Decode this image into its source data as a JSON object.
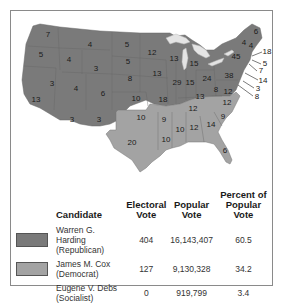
{
  "colors": {
    "republican": "#7a7a7a",
    "democrat": "#a3a3a3",
    "lakes": "#e4e4e4",
    "border": "#8a8a8a",
    "background": "#ffffff"
  },
  "map": {
    "title": "1920 Presidential Election Electoral Votes by State",
    "state_labels": [
      {
        "value": "7",
        "x": 48,
        "y": 37
      },
      {
        "value": "5",
        "x": 41,
        "y": 57
      },
      {
        "value": "4",
        "x": 69,
        "y": 62
      },
      {
        "value": "3",
        "x": 52,
        "y": 86
      },
      {
        "value": "13",
        "x": 36,
        "y": 102
      },
      {
        "value": "4",
        "x": 90,
        "y": 47
      },
      {
        "value": "3",
        "x": 96,
        "y": 71
      },
      {
        "value": "4",
        "x": 76,
        "y": 91
      },
      {
        "value": "3",
        "x": 72,
        "y": 122
      },
      {
        "value": "3",
        "x": 99,
        "y": 122
      },
      {
        "value": "6",
        "x": 103,
        "y": 96
      },
      {
        "value": "5",
        "x": 127,
        "y": 47
      },
      {
        "value": "5",
        "x": 128,
        "y": 64
      },
      {
        "value": "8",
        "x": 130,
        "y": 81
      },
      {
        "value": "10",
        "x": 136,
        "y": 101
      },
      {
        "value": "10",
        "x": 141,
        "y": 120
      },
      {
        "value": "20",
        "x": 132,
        "y": 145
      },
      {
        "value": "12",
        "x": 152,
        "y": 55
      },
      {
        "value": "13",
        "x": 157,
        "y": 76
      },
      {
        "value": "18",
        "x": 163,
        "y": 102
      },
      {
        "value": "9",
        "x": 164,
        "y": 122
      },
      {
        "value": "10",
        "x": 166,
        "y": 142
      },
      {
        "value": "13",
        "x": 174,
        "y": 61
      },
      {
        "value": "29",
        "x": 177,
        "y": 85
      },
      {
        "value": "15",
        "x": 190,
        "y": 85
      },
      {
        "value": "15",
        "x": 194,
        "y": 66
      },
      {
        "value": "24",
        "x": 207,
        "y": 81
      },
      {
        "value": "13",
        "x": 200,
        "y": 99
      },
      {
        "value": "12",
        "x": 193,
        "y": 111
      },
      {
        "value": "10",
        "x": 180,
        "y": 132
      },
      {
        "value": "12",
        "x": 194,
        "y": 130
      },
      {
        "value": "14",
        "x": 211,
        "y": 127
      },
      {
        "value": "9",
        "x": 223,
        "y": 119
      },
      {
        "value": "12",
        "x": 227,
        "y": 105
      },
      {
        "value": "8",
        "x": 216,
        "y": 92
      },
      {
        "value": "12",
        "x": 228,
        "y": 94
      },
      {
        "value": "38",
        "x": 229,
        "y": 78
      },
      {
        "value": "45",
        "x": 236,
        "y": 59
      },
      {
        "value": "4",
        "x": 244,
        "y": 45
      },
      {
        "value": "4",
        "x": 251,
        "y": 48
      },
      {
        "value": "6",
        "x": 256,
        "y": 34
      },
      {
        "value": "6",
        "x": 225,
        "y": 153
      }
    ],
    "callouts": [
      {
        "value": "18",
        "x": 267,
        "y": 54,
        "lx1": 252,
        "ly1": 56,
        "lx2": 262,
        "ly2": 52
      },
      {
        "value": "5",
        "x": 265,
        "y": 66,
        "lx1": 252,
        "ly1": 60,
        "lx2": 261,
        "ly2": 64
      },
      {
        "value": "7",
        "x": 261,
        "y": 73,
        "lx1": 249,
        "ly1": 64,
        "lx2": 257,
        "ly2": 71
      },
      {
        "value": "14",
        "x": 263,
        "y": 83,
        "lx1": 245,
        "ly1": 73,
        "lx2": 258,
        "ly2": 80
      },
      {
        "value": "3",
        "x": 258,
        "y": 91,
        "lx1": 243,
        "ly1": 81,
        "lx2": 254,
        "ly2": 88
      },
      {
        "value": "8",
        "x": 257,
        "y": 99,
        "lx1": 238,
        "ly1": 85,
        "lx2": 253,
        "ly2": 96
      }
    ]
  },
  "table": {
    "headers": [
      "Candidate",
      "Electoral Vote",
      "Popular Vote",
      "Percent of Popular Vote"
    ],
    "header_lines": [
      [
        "Candidate"
      ],
      [
        "Electoral",
        "Vote"
      ],
      [
        "Popular",
        "Vote"
      ],
      [
        "Percent of",
        "Popular Vote"
      ]
    ],
    "rows": [
      {
        "swatch": "republican",
        "name": "Warren G. Harding",
        "party": "(Republican)",
        "electoral": "404",
        "popular": "16,143,407",
        "percent": "60.5"
      },
      {
        "swatch": "democrat",
        "name": "James M. Cox",
        "party": "(Democrat)",
        "electoral": "127",
        "popular": "9,130,328",
        "percent": "34.2"
      },
      {
        "swatch": "none",
        "name": "Eugene V. Debs",
        "party": "(Socialist)",
        "electoral": "0",
        "popular": "919,799",
        "percent": "3.4"
      }
    ]
  }
}
